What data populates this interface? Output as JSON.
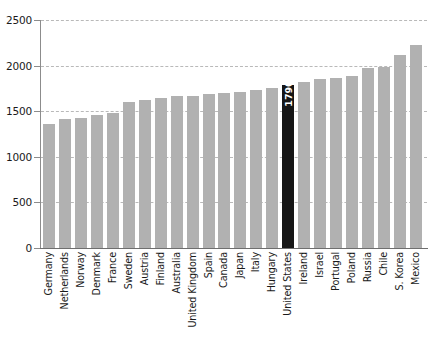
{
  "chart_data": {
    "type": "bar",
    "title": "",
    "xlabel": "",
    "ylabel": "",
    "ylim": [
      0,
      2500
    ],
    "yticks": [
      0,
      500,
      1000,
      1500,
      2000,
      2500
    ],
    "grid": true,
    "legend": "none",
    "categories": [
      "Germany",
      "Netherlands",
      "Norway",
      "Denmark",
      "France",
      "Sweden",
      "Austria",
      "Finland",
      "Australia",
      "United Kingdom",
      "Spain",
      "Canada",
      "Japan",
      "Italy",
      "Hungary",
      "United States",
      "Ireland",
      "Israel",
      "Portugal",
      "Poland",
      "Russia",
      "Chile",
      "S. Korea",
      "Mexico"
    ],
    "values": [
      1363,
      1419,
      1424,
      1457,
      1482,
      1606,
      1621,
      1645,
      1665,
      1669,
      1686,
      1703,
      1713,
      1730,
      1759,
      1790,
      1815,
      1853,
      1863,
      1885,
      1974,
      1990,
      2113,
      2230
    ],
    "highlight_index": 15,
    "highlight_label": "1790",
    "colors": {
      "bar": "#b1b1b1",
      "highlight_bar": "#161616",
      "highlight_label_text": "#ffffff",
      "gridline": "#b9b9b9",
      "axis": "#8c8c8c",
      "text": "#1a1a1a",
      "background": "#ffffff"
    }
  }
}
